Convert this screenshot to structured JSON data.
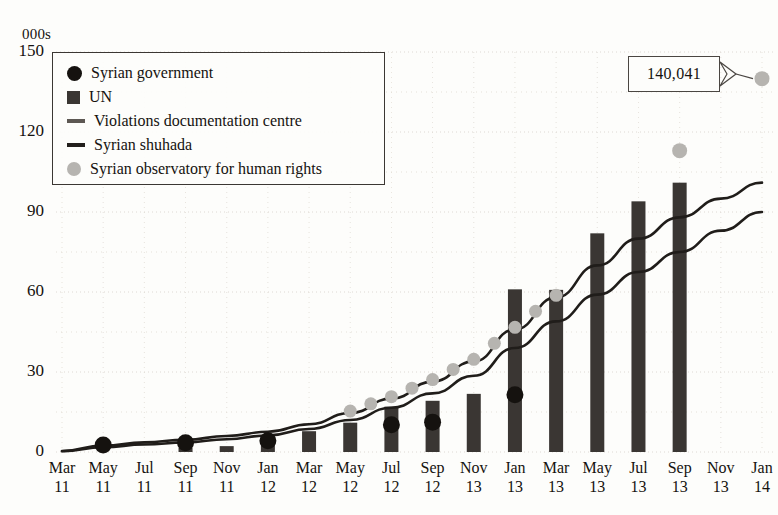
{
  "chart_data": {
    "type": "bar",
    "title": "",
    "subtitle": "",
    "unit_label": "000s",
    "xlabel": "",
    "ylabel": "",
    "ylim": [
      0,
      150
    ],
    "yticks": [
      0,
      30,
      60,
      90,
      120,
      150
    ],
    "grid": true,
    "legend_position": "top-left",
    "categories": [
      "Mar 11",
      "May 11",
      "Jul 11",
      "Sep 11",
      "Nov 11",
      "Jan 12",
      "Mar 12",
      "May 12",
      "Jul 12",
      "Sep 12",
      "Nov 12",
      "Jan 13",
      "Mar 13",
      "May 13",
      "Jul 13",
      "Sep 13",
      "Nov 13",
      "Jan 14"
    ],
    "xtick_months": [
      "Mar",
      "May",
      "Jul",
      "Sep",
      "Nov",
      "Jan",
      "Mar",
      "May",
      "Jul",
      "Sep",
      "Nov",
      "Jan",
      "Mar",
      "May",
      "Jul",
      "Sep",
      "Nov",
      "Jan"
    ],
    "xtick_years": [
      "11",
      "11",
      "11",
      "11",
      "11",
      "12",
      "12",
      "12",
      "12",
      "12",
      "13",
      "13",
      "13",
      "13",
      "13",
      "13",
      "13",
      "14"
    ],
    "series": [
      {
        "name": "Syrian government",
        "type": "scatter",
        "marker": "circle",
        "color": "#15120f",
        "x": [
          "May 11",
          "Sep 11",
          "Jan 12",
          "Jul 12",
          "Sep 12",
          "Jan 13"
        ],
        "values": [
          2.6,
          3.5,
          4.2,
          10.2,
          11.2,
          21.5
        ]
      },
      {
        "name": "UN",
        "type": "bar",
        "color": "#3a3633",
        "values": [
          0,
          0,
          0,
          1.6,
          2.2,
          3.2,
          7.8,
          11.0,
          17.0,
          19.2,
          21.8,
          61.0,
          60.8,
          82.0,
          94.0,
          101.0,
          0,
          0
        ]
      },
      {
        "name": "Violations documentation centre",
        "type": "line",
        "color": "#201d1a",
        "values": [
          0.4,
          2.4,
          3.6,
          4.6,
          6.0,
          7.6,
          10.4,
          14.6,
          20.0,
          26.4,
          34.0,
          46.0,
          58.0,
          70.0,
          80.0,
          88.0,
          95.0,
          101.0
        ]
      },
      {
        "name": "Syrian shuhada",
        "type": "line",
        "color": "#201d1a",
        "values": [
          0.3,
          1.8,
          2.8,
          3.6,
          4.8,
          6.2,
          8.6,
          12.0,
          16.6,
          22.0,
          28.6,
          39.0,
          49.0,
          59.0,
          67.5,
          75.0,
          83.0,
          90.0
        ]
      },
      {
        "name": "Syrian observatory for human rights",
        "type": "scatter",
        "marker": "circle",
        "color": "#b6b4b0",
        "x": [
          "May 12",
          "Jul 12",
          "Jul 12",
          "Sep 12",
          "Sep 12",
          "Nov 12",
          "Nov 12",
          "Jan 13",
          "Mar 13",
          "Sep 13",
          "Jan 14"
        ],
        "values": [
          13.5,
          18.0,
          22.5,
          27.0,
          31.5,
          37.0,
          42.0,
          51.0,
          62.0,
          113.0,
          140.0
        ]
      }
    ],
    "annotations": [
      {
        "name": "final-value-callout",
        "text": "140,041",
        "points_to_series": "Syrian observatory for human rights",
        "points_to_x": "Jan 14",
        "points_to_value": 140.041
      }
    ]
  },
  "legend": {
    "items": [
      {
        "label": "Syrian government",
        "marker": "dot-dark"
      },
      {
        "label": "UN",
        "marker": "square-dark"
      },
      {
        "label": "Violations documentation centre",
        "marker": "line-gray"
      },
      {
        "label": "Syrian shuhada",
        "marker": "line-dark"
      },
      {
        "label": "Syrian observatory for human rights",
        "marker": "dot-gray"
      }
    ]
  },
  "colors": {
    "bar": "#3a3633",
    "gov_dot": "#15120f",
    "sohr_dot": "#b6b4b0",
    "line": "#201d1a",
    "grid": "#ded9d2",
    "text": "#15120f",
    "background": "#fdfdfb"
  }
}
